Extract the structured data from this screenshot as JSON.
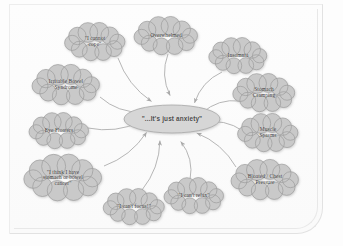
{
  "diagram": {
    "center": {
      "id": "center-anxiety",
      "label": "\"...It's just anxiety\"",
      "shape": "ellipse",
      "cx": 172,
      "cy": 119,
      "rx": 48,
      "ry": 14,
      "fill": "#d6d6d6",
      "stroke": "#a8a8a8"
    },
    "style": {
      "cloud_fill": "#c9c9c9",
      "cloud_stroke": "#9c9c9c",
      "arrow_color": "#a9a9a9",
      "text_color": "#3b3b3b",
      "page_background": "#fdfdfd",
      "frame_border": "#e2e2e2"
    },
    "nodes": [
      {
        "id": "cannot-cope",
        "label": "\"I cannot cope\"",
        "lines": [
          "\"I cannot",
          "cope\""
        ],
        "cx": 95,
        "cy": 42,
        "w": 58,
        "h": 36,
        "anchor_x": 118,
        "anchor_y": 58
      },
      {
        "id": "overwhelmed",
        "label": "Overwhelmed",
        "lines": [
          "Overwhelmed"
        ],
        "cx": 166,
        "cy": 36,
        "w": 62,
        "h": 36,
        "anchor_x": 168,
        "anchor_y": 54
      },
      {
        "id": "insomnia",
        "label": "Insomnia",
        "lines": [
          "Insomnia"
        ],
        "cx": 238,
        "cy": 56,
        "w": 56,
        "h": 34,
        "anchor_x": 222,
        "anchor_y": 72
      },
      {
        "id": "stomach-cramping",
        "label": "Stomach Cramping",
        "lines": [
          "Stomach",
          "Cramping"
        ],
        "cx": 264,
        "cy": 93,
        "w": 60,
        "h": 36,
        "anchor_x": 240,
        "anchor_y": 101
      },
      {
        "id": "muscle-spasms",
        "label": "Muscle Spasms",
        "lines": [
          "Muscle",
          "Spasms"
        ],
        "cx": 268,
        "cy": 133,
        "w": 58,
        "h": 36,
        "anchor_x": 243,
        "anchor_y": 131
      },
      {
        "id": "bloated-chest-pressure",
        "label": "Bloated / Chest Pressure",
        "lines": [
          "Bloated / Chest",
          "Pressure"
        ],
        "cx": 265,
        "cy": 180,
        "w": 66,
        "h": 38,
        "anchor_x": 236,
        "anchor_y": 167
      },
      {
        "id": "irritable-bowel-syndrome",
        "label": "Irritable Bowel Syndrome",
        "lines": [
          "Irritable Bowel",
          "Syndrome"
        ],
        "cx": 66,
        "cy": 85,
        "w": 66,
        "h": 38,
        "anchor_x": 100,
        "anchor_y": 97
      },
      {
        "id": "eye-floaters",
        "label": "Eye Floaters",
        "lines": [
          "Eye Floaters"
        ],
        "cx": 59,
        "cy": 131,
        "w": 58,
        "h": 34,
        "anchor_x": 88,
        "anchor_y": 128
      },
      {
        "id": "stomach-or-bowel-cancer",
        "label": "\"I think I have stomach or bowel cancer\"",
        "lines": [
          "\"I think I have",
          "stomach or bowel",
          "cancer\""
        ],
        "cx": 63,
        "cy": 178,
        "w": 76,
        "h": 44,
        "anchor_x": 104,
        "anchor_y": 166
      },
      {
        "id": "cannot-focus",
        "label": "\"I can't focus!\"",
        "lines": [
          "\"I can't focus!\""
        ],
        "cx": 134,
        "cy": 207,
        "w": 60,
        "h": 34,
        "anchor_x": 142,
        "anchor_y": 190
      },
      {
        "id": "cannot-relax",
        "label": "\"I can't relax\"",
        "lines": [
          "\"I can't relax\""
        ],
        "cx": 194,
        "cy": 196,
        "w": 58,
        "h": 34,
        "anchor_x": 190,
        "anchor_y": 180
      }
    ]
  }
}
